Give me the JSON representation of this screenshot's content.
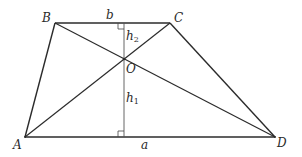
{
  "diagram": {
    "type": "trapezoid-with-diagonals",
    "vertices": {
      "A": {
        "label": "A",
        "x": 25,
        "y": 137
      },
      "B": {
        "label": "B",
        "x": 55,
        "y": 23
      },
      "C": {
        "label": "C",
        "x": 170,
        "y": 23
      },
      "D": {
        "label": "D",
        "x": 275,
        "y": 137
      },
      "O": {
        "label": "O",
        "x": 124,
        "y": 59
      }
    },
    "labels": {
      "top_base": "b",
      "bottom_base": "a",
      "h1_main": "h",
      "h1_sub": "1",
      "h2_main": "h",
      "h2_sub": "2"
    },
    "colors": {
      "stroke": "#2b2b2b",
      "altitude": "#555555",
      "background": "#ffffff"
    }
  }
}
